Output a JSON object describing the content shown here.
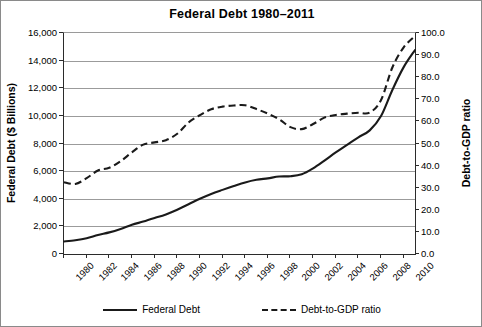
{
  "chart_data": {
    "type": "line",
    "title": "Federal Debt 1980–2011",
    "xlabel": "",
    "ylabel": "Federal Debt ($ Billions)",
    "y2label": "Debt-to-GDP ratio",
    "xlim": [
      1980,
      2011
    ],
    "ylim": [
      0,
      16000
    ],
    "y2lim": [
      0.0,
      100.0
    ],
    "grid": true,
    "legend_position": "bottom",
    "xticks": [
      "1980",
      "1982",
      "1984",
      "1986",
      "1988",
      "1990",
      "1992",
      "1994",
      "1996",
      "1998",
      "2000",
      "2002",
      "2004",
      "2006",
      "2008",
      "2010"
    ],
    "yticks_left": [
      "0",
      "2,000",
      "4,000",
      "6,000",
      "8,000",
      "10,000",
      "12,000",
      "14,000",
      "16,000"
    ],
    "yticks_right": [
      "0.0",
      "10.0",
      "20.0",
      "30.0",
      "40.0",
      "50.0",
      "60.0",
      "70.0",
      "80.0",
      "90.0",
      "100.0"
    ],
    "x": [
      1980,
      1981,
      1982,
      1983,
      1984,
      1985,
      1986,
      1987,
      1988,
      1989,
      1990,
      1991,
      1992,
      1993,
      1994,
      1995,
      1996,
      1997,
      1998,
      1999,
      2000,
      2001,
      2002,
      2003,
      2004,
      2005,
      2006,
      2007,
      2008,
      2009,
      2010,
      2011
    ],
    "series": [
      {
        "name": "Federal Debt",
        "axis": "left",
        "style": "solid",
        "units": "$ Billions",
        "values": [
          909,
          995,
          1137,
          1372,
          1565,
          1818,
          2120,
          2346,
          2601,
          2868,
          3206,
          3598,
          4002,
          4351,
          4643,
          4921,
          5181,
          5369,
          5478,
          5606,
          5629,
          5770,
          6198,
          6760,
          7355,
          7905,
          8451,
          8951,
          9986,
          11876,
          13529,
          14764
        ]
      },
      {
        "name": "Debt-to-GDP ratio",
        "axis": "right",
        "style": "dashed",
        "units": "percent of GDP",
        "values": [
          32.5,
          31.7,
          34.3,
          37.8,
          39.0,
          42.0,
          46.0,
          49.5,
          50.5,
          51.5,
          54.4,
          59.5,
          62.8,
          65.5,
          66.7,
          67.2,
          67.3,
          65.6,
          63.5,
          61.0,
          57.4,
          56.5,
          58.8,
          61.7,
          62.9,
          63.5,
          63.9,
          64.0,
          69.7,
          84.4,
          93.5,
          98.6
        ]
      }
    ]
  },
  "legend": {
    "entries": [
      {
        "label": "Federal Debt",
        "style": "solid"
      },
      {
        "label": "Debt-to-GDP ratio",
        "style": "dashed"
      }
    ]
  }
}
